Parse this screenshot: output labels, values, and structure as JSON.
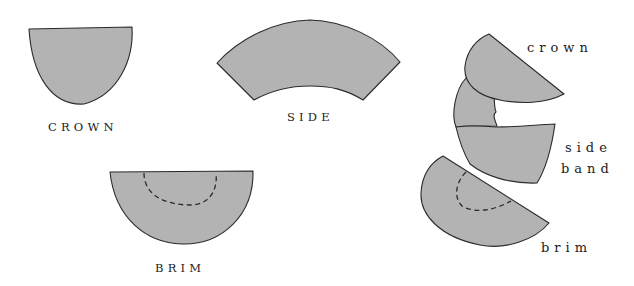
{
  "diagram": {
    "pattern_pieces": [
      {
        "id": "crown",
        "label": "CROWN"
      },
      {
        "id": "side",
        "label": "SIDE"
      },
      {
        "id": "brim",
        "label": "BRIM"
      }
    ],
    "assembly_labels": {
      "crown": "crown",
      "side_line1": "side",
      "side_line2": "band",
      "brim": "brim"
    },
    "colors": {
      "piece_fill": "#b3b3b3",
      "outline": "#2a2a2a",
      "background": "#ffffff"
    }
  }
}
